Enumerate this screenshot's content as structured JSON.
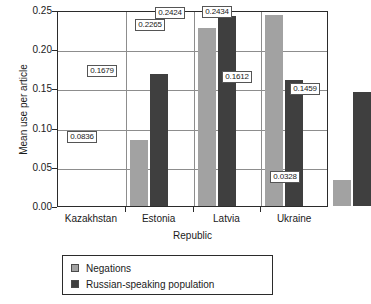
{
  "chart_data": {
    "type": "bar",
    "title": "",
    "xlabel": "Republic",
    "ylabel": "Mean use per article",
    "categories": [
      "Kazakhstan",
      "Estonia",
      "Latvia",
      "Ukraine"
    ],
    "series": [
      {
        "name": "Negations",
        "color": "#a2a2a2",
        "values": [
          0.0836,
          0.2265,
          0.2434,
          0.0328
        ],
        "labels": [
          "0.0836",
          "0.2265",
          "0.2434",
          "0.0328"
        ]
      },
      {
        "name": "Russian-speaking population",
        "color": "#3f3f3f",
        "values": [
          0.1679,
          0.2424,
          0.1612,
          0.1459
        ],
        "labels": [
          "0.1679",
          "0.2424",
          "0.1612",
          "0.1459"
        ]
      }
    ],
    "ylim": [
      0.0,
      0.25
    ],
    "ytick_labels": [
      "0.00",
      "0.05",
      "0.10",
      "0.15",
      "0.20",
      "0.25"
    ],
    "ytick_values": [
      0.0,
      0.05,
      0.1,
      0.15,
      0.2,
      0.25
    ],
    "grid": "horizontal",
    "legend_position": "below-plot"
  }
}
